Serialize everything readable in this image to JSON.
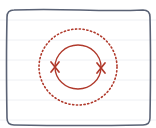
{
  "diagram": {
    "colors": {
      "frame": "#5a6275",
      "ink": "#b0392b",
      "ruled_line": "#eef0f4",
      "background": "#ffffff"
    },
    "frame": {
      "x": 7,
      "y": 10,
      "width": 143,
      "height": 115,
      "radius": 7
    },
    "ruled_lines_y": [
      20,
      40,
      60,
      80,
      100,
      120
    ],
    "solid_circle": {
      "cx": 78,
      "cy": 67,
      "rx": 23,
      "ry": 22
    },
    "dotted_circle": {
      "cx": 78,
      "cy": 67,
      "rx": 39,
      "ry": 38
    },
    "marks": [
      {
        "label": "x-mark-left",
        "x": 55,
        "y": 67
      },
      {
        "label": "x-mark-right",
        "x": 101,
        "y": 68
      }
    ]
  }
}
